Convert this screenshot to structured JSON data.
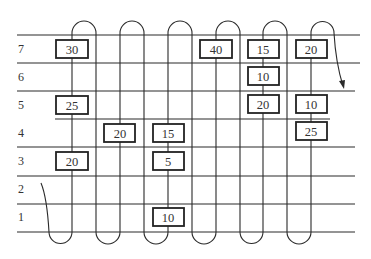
{
  "diagram": {
    "type": "serpentine-route-grid",
    "row_labels": [
      "7",
      "6",
      "5",
      "4",
      "3",
      "2",
      "1"
    ],
    "rows": [
      {
        "label": "7",
        "y": 49
      },
      {
        "label": "6",
        "y": 77
      },
      {
        "label": "5",
        "y": 104
      },
      {
        "label": "4",
        "y": 133
      },
      {
        "label": "3",
        "y": 161
      },
      {
        "label": "2",
        "y": 189
      },
      {
        "label": "1",
        "y": 217
      }
    ],
    "boxes": [
      {
        "value": "30",
        "row": "7",
        "x": 72
      },
      {
        "value": "40",
        "row": "7",
        "x": 216
      },
      {
        "value": "15",
        "row": "7",
        "x": 263
      },
      {
        "value": "20",
        "row": "7",
        "x": 311
      },
      {
        "value": "10",
        "row": "6",
        "x": 263
      },
      {
        "value": "25",
        "row": "5",
        "x": 72
      },
      {
        "value": "20",
        "row": "5",
        "x": 263
      },
      {
        "value": "10",
        "row": "5",
        "x": 311
      },
      {
        "value": "20",
        "row": "4",
        "x": 120
      },
      {
        "value": "15",
        "row": "4",
        "x": 168
      },
      {
        "value": "25",
        "row": "4",
        "x": 311
      },
      {
        "value": "20",
        "row": "3",
        "x": 72
      },
      {
        "value": "5",
        "row": "3",
        "x": 168
      },
      {
        "value": "10",
        "row": "1",
        "x": 168
      }
    ],
    "route": {
      "start": "bottom-left entry curve near row 2",
      "end": "arrow at right of row 6",
      "description": "Serpentine path up and down aisles"
    },
    "colors": {
      "line": "#2a2a2a",
      "text": "#333333",
      "background": "#ffffff"
    }
  }
}
